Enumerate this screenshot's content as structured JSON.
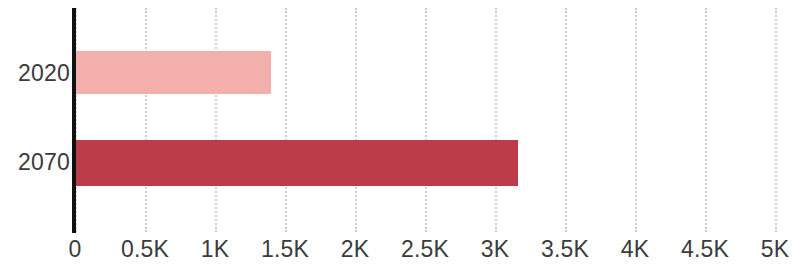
{
  "chart_data": {
    "type": "bar",
    "orientation": "horizontal",
    "title": "",
    "subtitle": "",
    "xlabel": "",
    "ylabel": "",
    "categories": [
      "2020",
      "2070"
    ],
    "values": [
      1400,
      3164
    ],
    "series": [
      {
        "name": "",
        "values": [
          1400,
          3164
        ]
      }
    ],
    "bar_colors": [
      "#f2afac",
      "#bd3c4a"
    ],
    "xlim": [
      0,
      5000
    ],
    "xticks": [
      0,
      500,
      1000,
      1500,
      2000,
      2500,
      3000,
      3500,
      4000,
      4500,
      5000
    ],
    "xtick_labels": [
      "0",
      "0.5K",
      "1K",
      "1.5K",
      "2K",
      "2.5K",
      "3K",
      "3.5K",
      "4K",
      "4.5K",
      "5K"
    ],
    "grid": true,
    "grid_axis": "x",
    "grid_style": "dotted",
    "grid_color": "#cfcfcf",
    "legend": false,
    "legend_position": "none",
    "axis_line_color": "#111111",
    "text_color": "#3b3b3b",
    "background_color": "#ffffff",
    "annotations": []
  },
  "axis": {
    "ticks": [
      {
        "label": "0",
        "value": 0
      },
      {
        "label": "0.5K",
        "value": 500
      },
      {
        "label": "1K",
        "value": 1000
      },
      {
        "label": "1.5K",
        "value": 1500
      },
      {
        "label": "2K",
        "value": 2000
      },
      {
        "label": "2.5K",
        "value": 2500
      },
      {
        "label": "3K",
        "value": 3000
      },
      {
        "label": "3.5K",
        "value": 3500
      },
      {
        "label": "4K",
        "value": 4000
      },
      {
        "label": "4.5K",
        "value": 4500
      },
      {
        "label": "5K",
        "value": 5000
      }
    ]
  },
  "categories": [
    {
      "label": "2020",
      "value": 1400,
      "color": "#f2afac"
    },
    {
      "label": "2070",
      "value": 3164,
      "color": "#bd3c4a"
    }
  ]
}
